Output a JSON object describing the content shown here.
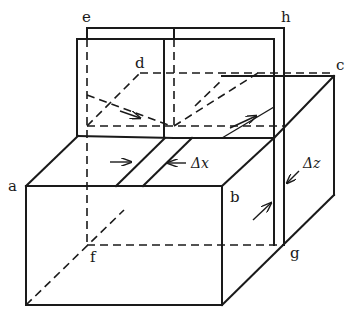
{
  "diagram": {
    "labels": {
      "a": "a",
      "b": "b",
      "c": "c",
      "d": "d",
      "e": "e",
      "f": "f",
      "g": "g",
      "h": "h",
      "dx": "Δx",
      "dz": "Δz"
    },
    "line_color": "#1a1a1a",
    "background": "#ffffff"
  }
}
